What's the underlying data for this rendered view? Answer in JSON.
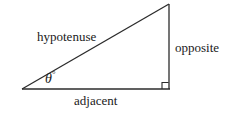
{
  "figure": {
    "type": "right-triangle-diagram",
    "background_color": "#ffffff",
    "stroke_color": "#2b2b2b",
    "labels": {
      "hypotenuse": "hypotenuse",
      "opposite": "opposite",
      "adjacent": "adjacent",
      "angle_symbol": "θ",
      "angle_degree_mark": "°"
    },
    "geometry": {
      "left_vertex": [
        22,
        89
      ],
      "right_angle_vertex": [
        169,
        89
      ],
      "top_vertex": [
        169,
        4
      ],
      "right_angle_marker_size": 6
    }
  }
}
